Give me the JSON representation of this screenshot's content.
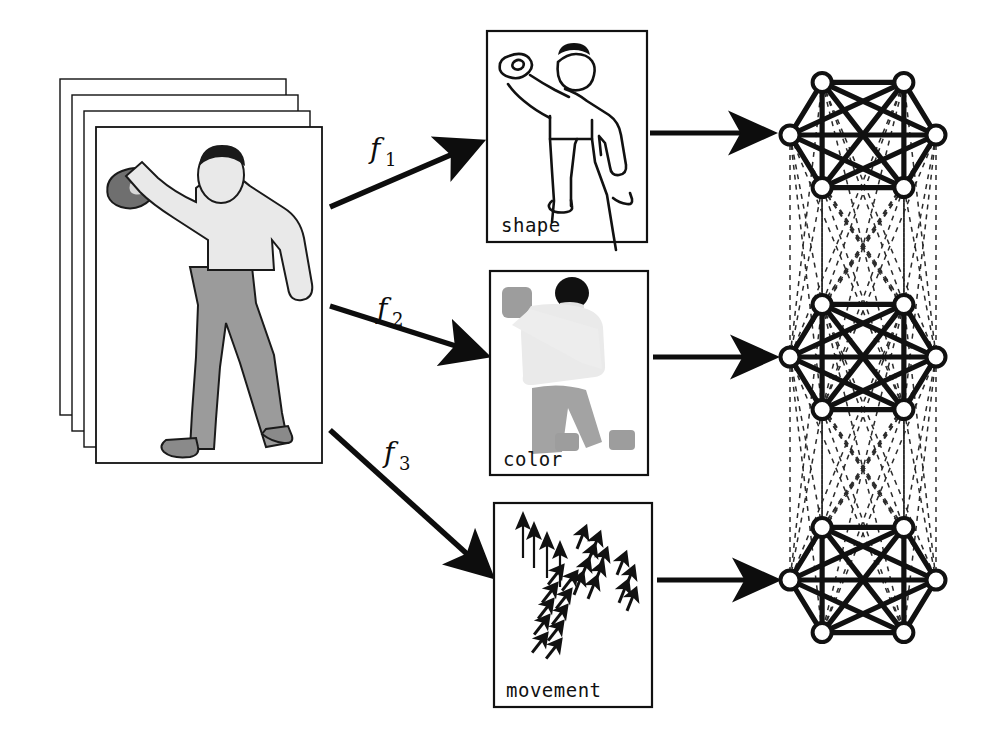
{
  "figure": {
    "title": "",
    "background_color": "#ffffff",
    "ink_color": "#111111"
  },
  "input_stack": {
    "name": "video-frame-stack",
    "frame_count": 4,
    "description": "stack of video frames showing a person throwing a ball",
    "front_frame": {
      "x": 96,
      "y": 127,
      "width": 226,
      "height": 336
    },
    "offset_x": -12,
    "offset_y": -12,
    "figure_colors": {
      "skin_shirt": "#e9e9e9",
      "trousers": "#9b9b9b",
      "hair": "#1a1a1a",
      "ball": "#6f6f6f",
      "outline": "#1a1a1a"
    }
  },
  "feature_arrows": [
    {
      "name": "f1",
      "label": "f",
      "subscript": "1",
      "label_x": 372,
      "label_y": 158,
      "x1": 330,
      "y1": 207,
      "x2": 481,
      "y2": 142,
      "target": "shape"
    },
    {
      "name": "f2",
      "label": "f",
      "subscript": "2",
      "label_x": 379,
      "label_y": 318,
      "x1": 330,
      "y1": 306,
      "x2": 486,
      "y2": 355,
      "target": "color"
    },
    {
      "name": "f3",
      "label": "f",
      "subscript": "3",
      "label_x": 386,
      "label_y": 462,
      "x1": 330,
      "y1": 430,
      "x2": 492,
      "y2": 574,
      "target": "movement"
    }
  ],
  "feature_panels": [
    {
      "name": "shape-panel",
      "label": "shape",
      "x": 487,
      "y": 31,
      "width": 160,
      "height": 211,
      "content": "line-drawing outline of the thrower",
      "fill": "#ffffff",
      "stroke": "#111111"
    },
    {
      "name": "color-panel",
      "label": "color",
      "x": 490,
      "y": 271,
      "width": 158,
      "height": 204,
      "content": "flat color blobs: gray squares, dark head disc, light torso, gray trousers",
      "fill": "#ffffff",
      "stroke": "#111111"
    },
    {
      "name": "movement-panel",
      "label": "movement",
      "x": 494,
      "y": 503,
      "width": 158,
      "height": 204,
      "content": "field of motion-vector arrows",
      "fill": "#ffffff",
      "stroke": "#111111"
    }
  ],
  "link_arrows": [
    {
      "name": "shape-to-graph-arrow",
      "x1": 650,
      "y1": 133,
      "x2": 772,
      "y2": 133
    },
    {
      "name": "color-to-graph-arrow",
      "x1": 653,
      "y1": 357,
      "x2": 774,
      "y2": 357
    },
    {
      "name": "movement-to-graph-arrow",
      "x1": 657,
      "y1": 580,
      "x2": 776,
      "y2": 580
    }
  ],
  "graphs": [
    {
      "name": "shape-graph",
      "cx": 863,
      "cy": 135,
      "rx": 73,
      "ry": 71,
      "node_count": 6,
      "fully_connected": true,
      "node_fill": "#ffffff",
      "node_stroke": "#111111",
      "edge_color": "#111111"
    },
    {
      "name": "color-graph",
      "cx": 863,
      "cy": 357,
      "rx": 73,
      "ry": 71,
      "node_count": 6,
      "fully_connected": true,
      "node_fill": "#ffffff",
      "node_stroke": "#111111",
      "edge_color": "#111111"
    },
    {
      "name": "movement-graph",
      "cx": 863,
      "cy": 580,
      "rx": 73,
      "ry": 71,
      "node_count": 6,
      "fully_connected": true,
      "node_fill": "#ffffff",
      "node_stroke": "#111111",
      "edge_color": "#111111"
    }
  ],
  "inter_graph_links": {
    "name": "dashed-cross-layer-links",
    "style": "dashed",
    "color": "#2b2b2b",
    "pairs": [
      {
        "from": "shape-graph",
        "to": "color-graph"
      },
      {
        "from": "color-graph",
        "to": "movement-graph"
      }
    ],
    "complete_bipartite": true
  },
  "chart_data": {
    "type": "diagram",
    "title": "",
    "nodes": [
      {
        "id": "input",
        "label": "video frame stack"
      },
      {
        "id": "shape",
        "label": "shape"
      },
      {
        "id": "color",
        "label": "color"
      },
      {
        "id": "movement",
        "label": "movement"
      },
      {
        "id": "shape-graph",
        "label": ""
      },
      {
        "id": "color-graph",
        "label": ""
      },
      {
        "id": "movement-graph",
        "label": ""
      }
    ],
    "edges": [
      {
        "from": "input",
        "to": "shape",
        "label": "f1"
      },
      {
        "from": "input",
        "to": "color",
        "label": "f2"
      },
      {
        "from": "input",
        "to": "movement",
        "label": "f3"
      },
      {
        "from": "shape",
        "to": "shape-graph",
        "label": ""
      },
      {
        "from": "color",
        "to": "color-graph",
        "label": ""
      },
      {
        "from": "movement",
        "to": "movement-graph",
        "label": ""
      },
      {
        "from": "shape-graph",
        "to": "color-graph",
        "label": "",
        "style": "dashed"
      },
      {
        "from": "color-graph",
        "to": "movement-graph",
        "label": "",
        "style": "dashed"
      }
    ]
  }
}
